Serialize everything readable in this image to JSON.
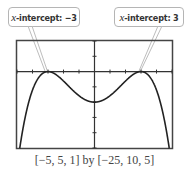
{
  "callouts": {
    "left": {
      "var": "x",
      "text": "-intercept: −3"
    },
    "right": {
      "var": "x",
      "text": "-intercept: 3"
    }
  },
  "caption": "[−5, 5, 1] by [−25, 10, 5]",
  "chart_data": {
    "type": "line",
    "title": "",
    "xlabel": "",
    "ylabel": "",
    "window": {
      "xmin": -5,
      "xmax": 5,
      "xscl": 1,
      "ymin": -25,
      "ymax": 10,
      "yscl": 5
    },
    "xlim": [
      -5,
      5
    ],
    "ylim": [
      -25,
      10
    ],
    "grid": false,
    "series": [
      {
        "name": "f(x)",
        "function": "x^4 - 10x^2 + 9 scaled shape (W-shaped quartic)",
        "x": [
          -3.2,
          -3,
          -2.5,
          -2.24,
          -2,
          -1.5,
          -1,
          -0.5,
          0,
          0.5,
          1,
          1.5,
          2,
          2.24,
          2.5,
          3,
          3.2
        ],
        "y": [
          10,
          0,
          -15,
          -25,
          -22,
          -14,
          -5,
          -0.5,
          -10,
          -0.5,
          -5,
          -14,
          -22,
          -25,
          -15,
          0,
          10
        ]
      },
      {
        "name": "approx shape",
        "note": "W-shaped quartic; zeros at x=-3 and x=3; local max at (0,-10); minima near (±2.1, -25)"
      }
    ],
    "annotations": [
      "x-intercept: −3",
      "x-intercept: 3"
    ]
  }
}
